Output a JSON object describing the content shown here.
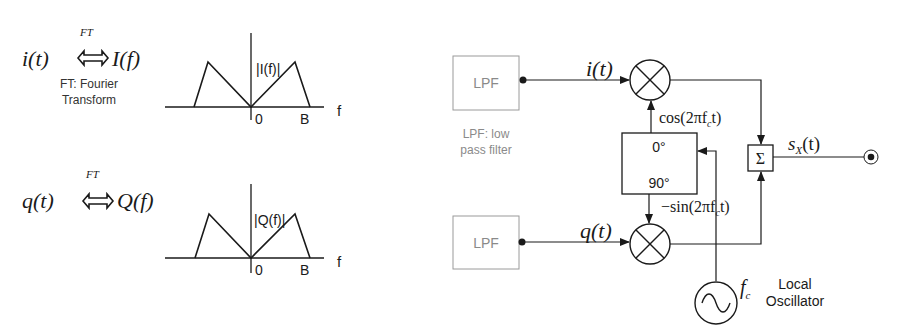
{
  "left_panel": {
    "i_pair": {
      "time_signal": "i(t)",
      "ft_label": "FT",
      "freq_signal": "I(f)"
    },
    "ft_note_line1": "FT: Fourier",
    "ft_note_line2": "Transform",
    "q_pair": {
      "time_signal": "q(t)",
      "ft_label": "FT",
      "freq_signal": "Q(f)"
    },
    "spectrum_i": {
      "label": "|I(f)|",
      "origin_label": "0",
      "band_label": "B",
      "axis_label": "f"
    },
    "spectrum_q": {
      "label": "|Q(f)|",
      "origin_label": "0",
      "band_label": "B",
      "axis_label": "f"
    }
  },
  "modulator": {
    "lpf_top_label": "LPF",
    "lpf_bottom_label": "LPF",
    "lpf_note_line1": "LPF: low",
    "lpf_note_line2": "pass filter",
    "i_input": "i(t)",
    "q_input": "q(t)",
    "cos_carrier": "cos(2πf",
    "cos_sub": "c",
    "cos_tail": "t)",
    "sin_carrier": "−sin(2πf",
    "sin_sub": "c",
    "sin_tail": "t)",
    "phase_top": "0°",
    "phase_bottom": "90°",
    "sum_symbol": "Σ",
    "output_signal": "s",
    "output_sub": "X",
    "output_tail": "(t)",
    "oscillator_freq": "f",
    "oscillator_freq_sub": "c",
    "oscillator_label_line1": "Local",
    "oscillator_label_line2": "Oscillator"
  },
  "colors": {
    "line": "#1a1a1a",
    "lpf_gray": "#8a8a8a"
  }
}
